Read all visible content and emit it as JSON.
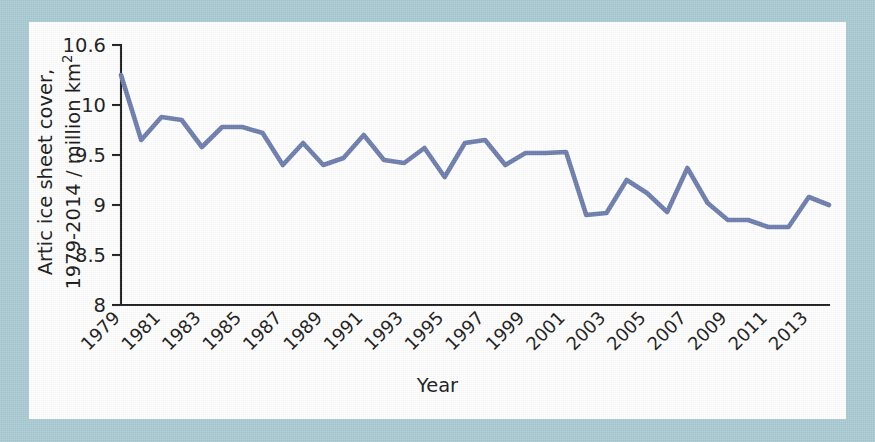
{
  "figure": {
    "background_color": "#a9cad2",
    "panel_color": "#ffffff",
    "line_color": "#6b7cad",
    "axis_color": "#1c1c1c"
  },
  "axis_titles": {
    "y_line1": "Artic ice sheet cover,",
    "y_line2_pre": "1979-2014 / million km",
    "y_line2_sup": "2",
    "x": "Year"
  },
  "chart_data": {
    "type": "line",
    "title": "",
    "xlabel": "Year",
    "ylabel": "Artic ice sheet cover, 1979-2014 / million km2",
    "xlim": [
      1979,
      2014
    ],
    "ylim": [
      8,
      10.6
    ],
    "grid": false,
    "legend": null,
    "ytick_labels": [
      "10.6",
      "10",
      "9.5",
      "9",
      "8.5",
      "8"
    ],
    "ytick_values": [
      10.6,
      10,
      9.5,
      9,
      8.5,
      8
    ],
    "xtick_labels": [
      "1979",
      "1981",
      "1983",
      "1985",
      "1987",
      "1989",
      "1991",
      "1993",
      "1995",
      "1997",
      "1999",
      "2001",
      "2003",
      "2005",
      "2007",
      "2009",
      "2011",
      "2013"
    ],
    "xtick_values": [
      1979,
      1981,
      1983,
      1985,
      1987,
      1989,
      1991,
      1993,
      1995,
      1997,
      1999,
      2001,
      2003,
      2005,
      2007,
      2009,
      2011,
      2013
    ],
    "x": [
      1979,
      1980,
      1981,
      1982,
      1983,
      1984,
      1985,
      1986,
      1987,
      1988,
      1989,
      1990,
      1991,
      1992,
      1993,
      1994,
      1995,
      1996,
      1997,
      1998,
      1999,
      2000,
      2001,
      2002,
      2003,
      2004,
      2005,
      2006,
      2007,
      2008,
      2009,
      2010,
      2011,
      2012,
      2013,
      2014
    ],
    "values": [
      10.3,
      9.65,
      9.88,
      9.85,
      9.58,
      9.78,
      9.78,
      9.72,
      9.4,
      9.62,
      9.4,
      9.47,
      9.7,
      9.45,
      9.42,
      9.57,
      9.28,
      9.62,
      9.65,
      9.4,
      9.52,
      9.52,
      9.53,
      8.9,
      8.92,
      9.25,
      9.12,
      8.93,
      9.37,
      9.02,
      8.85,
      8.85,
      8.78,
      8.78,
      9.08,
      9.0
    ],
    "series": [
      {
        "name": "Arctic ice sheet cover",
        "color": "#6b7cad",
        "values": [
          10.3,
          9.65,
          9.88,
          9.85,
          9.58,
          9.78,
          9.78,
          9.72,
          9.4,
          9.62,
          9.4,
          9.47,
          9.7,
          9.45,
          9.42,
          9.57,
          9.28,
          9.62,
          9.65,
          9.4,
          9.52,
          9.52,
          9.53,
          8.9,
          8.92,
          9.25,
          9.12,
          8.93,
          9.37,
          9.02,
          8.85,
          8.85,
          8.78,
          8.78,
          9.08,
          9.0
        ]
      }
    ]
  }
}
